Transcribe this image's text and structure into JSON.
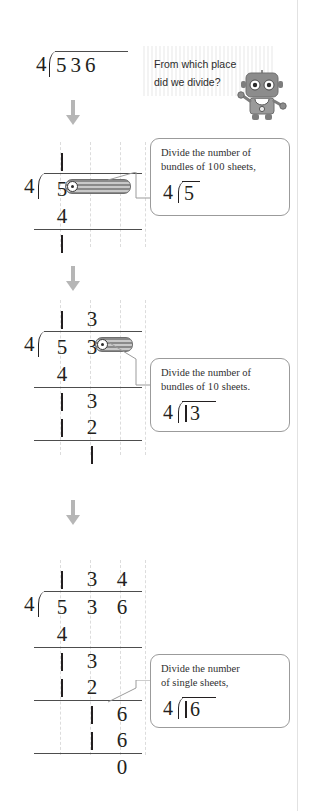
{
  "page": {
    "right_margin_rule": true
  },
  "problem": {
    "divisor": "4",
    "dividend": "536",
    "quotient": "134",
    "remainder": "0",
    "header_expression": "4)536"
  },
  "question_bubble": {
    "line1": "From which place",
    "line2": "did we divide?",
    "mascot": "robot-mascot"
  },
  "steps": [
    {
      "id": "step-1",
      "label": "divide-hundreds",
      "quotient_digits": [
        "1",
        "",
        ""
      ],
      "dividend_digits": [
        "5",
        "",
        ""
      ],
      "subtract_digits": [
        "4",
        "",
        ""
      ],
      "result_digits": [
        "1",
        "",
        ""
      ],
      "highlight_bar": "covers-tens-and-ones",
      "callout": {
        "text_line1": "Divide the number of",
        "text_line2_pre": "bundles of ",
        "text_line2_num": "100",
        "text_line2_post": " sheets,",
        "mini_divisor": "4",
        "mini_dividend": "5"
      }
    },
    {
      "id": "step-2",
      "label": "divide-tens",
      "quotient_digits": [
        "1",
        "3",
        ""
      ],
      "dividend_digits": [
        "5",
        "3",
        ""
      ],
      "subtract_digits": [
        "4",
        "",
        ""
      ],
      "bring_down_digits": [
        "1",
        "3",
        ""
      ],
      "subtract2_digits": [
        "1",
        "2",
        ""
      ],
      "result_digits": [
        "",
        "1",
        ""
      ],
      "highlight_bar": "covers-ones",
      "callout": {
        "text_line1": "Divide the number of",
        "text_line2_pre": "bundles of ",
        "text_line2_num": "10",
        "text_line2_post": " sheets.",
        "mini_divisor": "4",
        "mini_dividend": "13"
      }
    },
    {
      "id": "step-3",
      "label": "divide-ones",
      "quotient_digits": [
        "1",
        "3",
        "4"
      ],
      "dividend_digits": [
        "5",
        "3",
        "6"
      ],
      "subtract_digits": [
        "4",
        "",
        ""
      ],
      "bring_down_digits": [
        "1",
        "3",
        ""
      ],
      "subtract2_digits": [
        "1",
        "2",
        ""
      ],
      "bring_down2_digits": [
        "",
        "1",
        "6"
      ],
      "subtract3_digits": [
        "",
        "1",
        "6"
      ],
      "result_digits": [
        "",
        "",
        "0"
      ],
      "highlight_bar": "none",
      "callout": {
        "text_line1": "Divide the number",
        "text_line2_pre": "of single sheets,",
        "text_line2_num": "",
        "text_line2_post": "",
        "mini_divisor": "4",
        "mini_dividend": "16"
      }
    }
  ],
  "arrows": [
    {
      "name": "arrow-step1"
    },
    {
      "name": "arrow-step2"
    },
    {
      "name": "arrow-step3"
    }
  ],
  "colors": {
    "ink": "#231f20",
    "rule": "#4d4d4d",
    "guide": "#dcdcdc",
    "arrow": "#b6b6b6",
    "bar_dark": "#8a8a8a",
    "bar_light": "#c9c9c9",
    "callout_border": "#9b9b9b"
  }
}
